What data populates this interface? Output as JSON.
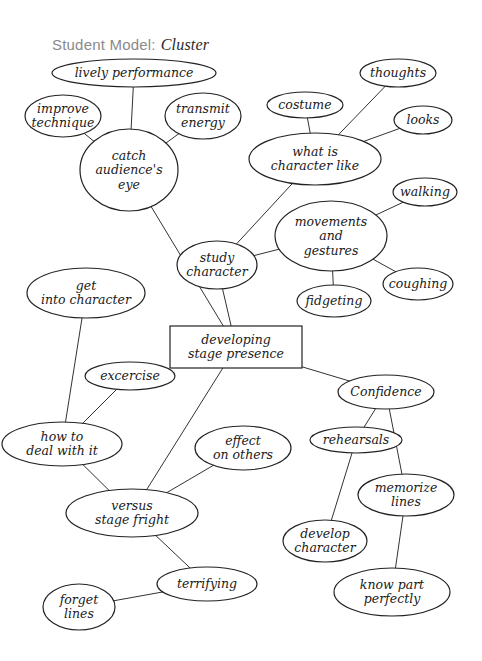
{
  "title": {
    "label": "Student Model:",
    "emphasis": "Cluster"
  },
  "center": {
    "id": "center",
    "lines": [
      "developing",
      "stage presence"
    ],
    "x": 236,
    "y": 347,
    "w": 132,
    "h": 42,
    "shape": "rect"
  },
  "nodes": [
    {
      "id": "lively",
      "lines": [
        "lively performance"
      ],
      "x": 134,
      "y": 73,
      "rx": 82,
      "ry": 14
    },
    {
      "id": "improve",
      "lines": [
        "improve",
        "technique"
      ],
      "x": 63,
      "y": 116,
      "rx": 38,
      "ry": 21
    },
    {
      "id": "transmit",
      "lines": [
        "transmit",
        "energy"
      ],
      "x": 203,
      "y": 116,
      "rx": 38,
      "ry": 23
    },
    {
      "id": "catch",
      "lines": [
        "catch",
        "audience's",
        "eye"
      ],
      "x": 129,
      "y": 170,
      "rx": 49,
      "ry": 41
    },
    {
      "id": "thoughts",
      "lines": [
        "thoughts"
      ],
      "x": 398,
      "y": 73,
      "rx": 38,
      "ry": 14
    },
    {
      "id": "costume",
      "lines": [
        "costume"
      ],
      "x": 305,
      "y": 105,
      "rx": 38,
      "ry": 13
    },
    {
      "id": "looks",
      "lines": [
        "looks"
      ],
      "x": 423,
      "y": 120,
      "rx": 29,
      "ry": 14
    },
    {
      "id": "whatis",
      "lines": [
        "what is",
        "character like"
      ],
      "x": 315,
      "y": 159,
      "rx": 66,
      "ry": 26
    },
    {
      "id": "walking",
      "lines": [
        "walking"
      ],
      "x": 425,
      "y": 192,
      "rx": 32,
      "ry": 14
    },
    {
      "id": "movements",
      "lines": [
        "movements",
        "and",
        "gestures"
      ],
      "x": 331,
      "y": 236,
      "rx": 56,
      "ry": 35
    },
    {
      "id": "study",
      "lines": [
        "study",
        "character"
      ],
      "x": 217,
      "y": 265,
      "rx": 40,
      "ry": 24
    },
    {
      "id": "fidgeting",
      "lines": [
        "fidgeting"
      ],
      "x": 334,
      "y": 301,
      "rx": 37,
      "ry": 16
    },
    {
      "id": "coughing",
      "lines": [
        "coughing"
      ],
      "x": 418,
      "y": 284,
      "rx": 35,
      "ry": 16
    },
    {
      "id": "getinto",
      "lines": [
        "get",
        "into character"
      ],
      "x": 86,
      "y": 293,
      "rx": 59,
      "ry": 25
    },
    {
      "id": "excercise",
      "lines": [
        "excercise"
      ],
      "x": 130,
      "y": 376,
      "rx": 45,
      "ry": 14
    },
    {
      "id": "confidence",
      "lines": [
        "Confidence"
      ],
      "x": 386,
      "y": 392,
      "rx": 48,
      "ry": 17
    },
    {
      "id": "rehearsals",
      "lines": [
        "rehearsals"
      ],
      "x": 356,
      "y": 440,
      "rx": 46,
      "ry": 13
    },
    {
      "id": "howto",
      "lines": [
        "how to",
        "deal with it"
      ],
      "x": 62,
      "y": 444,
      "rx": 60,
      "ry": 22
    },
    {
      "id": "effect",
      "lines": [
        "effect",
        "on others"
      ],
      "x": 243,
      "y": 448,
      "rx": 48,
      "ry": 22
    },
    {
      "id": "memorize",
      "lines": [
        "memorize",
        "lines"
      ],
      "x": 406,
      "y": 495,
      "rx": 48,
      "ry": 21
    },
    {
      "id": "versus",
      "lines": [
        "versus",
        "stage fright"
      ],
      "x": 132,
      "y": 513,
      "rx": 66,
      "ry": 24
    },
    {
      "id": "develop",
      "lines": [
        "develop",
        "character"
      ],
      "x": 325,
      "y": 541,
      "rx": 42,
      "ry": 21
    },
    {
      "id": "terrifying",
      "lines": [
        "terrifying"
      ],
      "x": 207,
      "y": 584,
      "rx": 50,
      "ry": 17
    },
    {
      "id": "forget",
      "lines": [
        "forget",
        "lines"
      ],
      "x": 79,
      "y": 607,
      "rx": 36,
      "ry": 23
    },
    {
      "id": "knowpart",
      "lines": [
        "know part",
        "perfectly"
      ],
      "x": 392,
      "y": 592,
      "rx": 58,
      "ry": 24
    }
  ],
  "edges": [
    [
      "lively",
      "catch"
    ],
    [
      "improve",
      "catch"
    ],
    [
      "transmit",
      "catch"
    ],
    [
      "catch",
      "center"
    ],
    [
      "costume",
      "whatis"
    ],
    [
      "thoughts",
      "whatis"
    ],
    [
      "looks",
      "whatis"
    ],
    [
      "whatis",
      "study"
    ],
    [
      "walking",
      "movements"
    ],
    [
      "movements",
      "study"
    ],
    [
      "movements",
      "fidgeting"
    ],
    [
      "movements",
      "coughing"
    ],
    [
      "study",
      "center"
    ],
    [
      "getinto",
      "howto"
    ],
    [
      "excercise",
      "howto"
    ],
    [
      "center",
      "versus"
    ],
    [
      "center",
      "confidence"
    ],
    [
      "confidence",
      "rehearsals"
    ],
    [
      "confidence",
      "memorize"
    ],
    [
      "rehearsals",
      "develop"
    ],
    [
      "memorize",
      "knowpart"
    ],
    [
      "howto",
      "versus"
    ],
    [
      "effect",
      "versus"
    ],
    [
      "versus",
      "terrifying"
    ],
    [
      "terrifying",
      "forget"
    ]
  ]
}
